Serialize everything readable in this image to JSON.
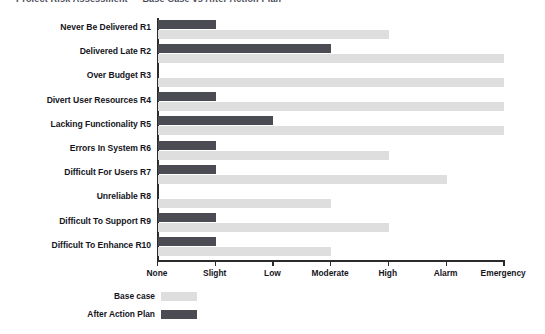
{
  "title_sliver": "Project Risk Assessment — Base Case vs After Action Plan",
  "legend": {
    "position": "below-axis-left",
    "items": [
      {
        "label": "Base case",
        "color": "#dedede",
        "key": "base"
      },
      {
        "label": "After Action Plan",
        "color": "#4b4b54",
        "key": "after"
      }
    ]
  },
  "axis": {
    "tick_labels": [
      "None",
      "Slight",
      "Low",
      "Moderate",
      "High",
      "Alarm",
      "Emergency"
    ],
    "tick_values": [
      0,
      1,
      2,
      3,
      4,
      5,
      6
    ]
  },
  "chart_data": {
    "type": "bar",
    "orientation": "horizontal",
    "title": "",
    "xlabel": "",
    "ylabel": "",
    "xlim": [
      0,
      6
    ],
    "grid": false,
    "legend_position": "bottom-left",
    "x_tick_labels": [
      "None",
      "Slight",
      "Low",
      "Moderate",
      "High",
      "Alarm",
      "Emergency"
    ],
    "x_tick_values": [
      0,
      1,
      2,
      3,
      4,
      5,
      6
    ],
    "categories": [
      "Never Be Delivered R1",
      "Delivered Late R2",
      "Over Budget  R3",
      "Divert User Resources R4",
      "Lacking Functionality R5",
      "Errors In System R6",
      "Difficult For Users R7",
      "Unreliable R8",
      "Difficult To Support R9",
      "Difficult To Enhance R10"
    ],
    "series": [
      {
        "name": "After Action Plan",
        "color": "#4b4b54",
        "values": [
          1,
          3,
          0,
          1,
          2,
          1,
          1,
          0,
          1,
          1
        ],
        "value_labels": [
          "Slight",
          "Moderate",
          "None",
          "Slight",
          "Low",
          "Slight",
          "Slight",
          "None",
          "Slight",
          "Slight"
        ]
      },
      {
        "name": "Base case",
        "color": "#dedede",
        "values": [
          4,
          6,
          6,
          6,
          6,
          4,
          5,
          3,
          4,
          3
        ],
        "value_labels": [
          "High",
          "Emergency",
          "Emergency",
          "Emergency",
          "Emergency",
          "High",
          "Alarm",
          "Moderate",
          "High",
          "Moderate"
        ]
      }
    ]
  }
}
